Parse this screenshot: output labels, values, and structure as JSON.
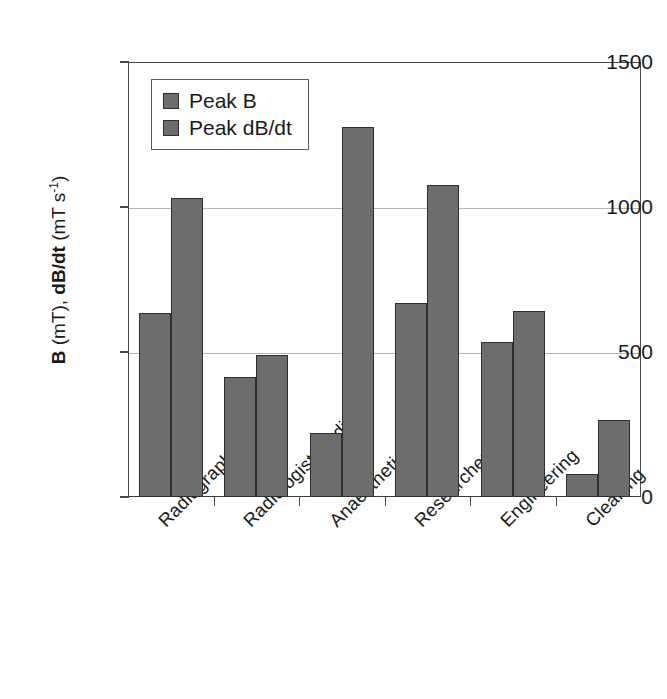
{
  "chart_data": {
    "type": "bar",
    "title": "",
    "subtitle": "",
    "xlabel": "",
    "ylabel": "B (mT), dB/dt (mT s-1)",
    "ylim": [
      0,
      1500
    ],
    "yticks": [
      0,
      500,
      1000,
      1500
    ],
    "ytick_labels": [
      "0",
      "500",
      "1000",
      "1500"
    ],
    "grid": "horizontal-only",
    "legend_position": "upper-left-inside",
    "categories": [
      "Radiographer",
      "Radiologist/medical",
      "Anaesthetics",
      "Researcher",
      "Engineering",
      "Cleaning"
    ],
    "series": [
      {
        "name": "Peak B",
        "values": [
          635,
          415,
          220,
          670,
          535,
          80
        ],
        "color": "#6d6d6d"
      },
      {
        "name": "Peak dB/dt",
        "values": [
          1030,
          490,
          1275,
          1075,
          640,
          265
        ],
        "color": "#6d6d6d"
      }
    ]
  },
  "axis": {
    "y_title_part1": "B",
    "y_title_part2": " (mT), ",
    "y_title_part3": "dB/dt",
    "y_title_part4": " (mT s",
    "y_title_exponent": "-1",
    "y_title_part5": ")"
  },
  "legend": {
    "items": [
      {
        "label": "Peak B"
      },
      {
        "label": "Peak dB/dt"
      }
    ]
  },
  "colors": {
    "bar_fill": "#6d6d6d",
    "bar_stroke": "#2e2e2e",
    "axis": "#4a4a4a",
    "gridline": "#b4b4b4",
    "background": "#ffffff",
    "text": "#1a1a1a"
  }
}
